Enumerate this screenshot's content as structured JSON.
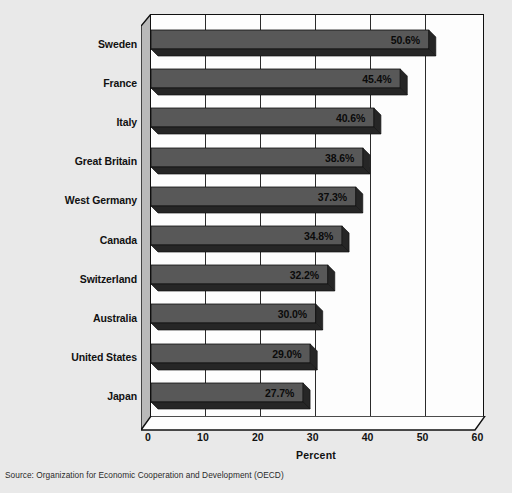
{
  "chart_data": {
    "type": "bar",
    "orientation": "horizontal",
    "title": "",
    "subtitle": "",
    "xlabel": "Percent",
    "ylabel": "",
    "xlim": [
      0,
      60
    ],
    "xticks": [
      0,
      10,
      20,
      30,
      40,
      50,
      60
    ],
    "xtick_labels": [
      "0",
      "10",
      "20",
      "30",
      "40",
      "50",
      "60"
    ],
    "grid": true,
    "grid_axis": "x",
    "legend": false,
    "categories": [
      "Sweden",
      "France",
      "Italy",
      "Great Britain",
      "West Germany",
      "Canada",
      "Switzerland",
      "Australia",
      "United States",
      "Japan"
    ],
    "values": [
      50.6,
      45.4,
      40.6,
      38.6,
      37.3,
      34.8,
      32.2,
      30.0,
      29.0,
      27.7
    ],
    "data_labels": [
      "50.6%",
      "45.4%",
      "40.6%",
      "38.6%",
      "37.3%",
      "34.8%",
      "32.2%",
      "30.0%",
      "29.0%",
      "27.7%"
    ],
    "bar_style": "3d-block",
    "colors": {
      "bar_face": "#585858",
      "bar_shadow": "#262626",
      "bar_top": "#6e6e6e",
      "plot_background": "#fdfdfd",
      "figure_background": "#e9e9e9",
      "axis_line": "#101010",
      "grid_line": "#2b2b2b",
      "text": "#111111",
      "wall_fill": "#b9b9b9"
    }
  },
  "source": {
    "note": "Source: Organization for Economic Cooperation and Development (OECD)"
  }
}
